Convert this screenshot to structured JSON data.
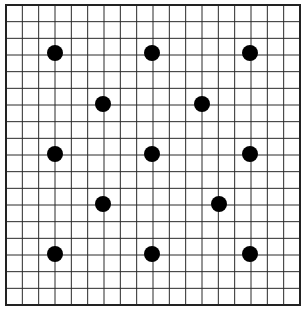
{
  "diagram": {
    "type": "dot-grid",
    "grid": {
      "columns": 18,
      "rows": 18,
      "left": 6,
      "top": 5,
      "right": 300,
      "bottom": 305,
      "line_color": "#2a2a2a",
      "border_color": "#222222"
    },
    "dot_color": "#000000",
    "dot_radius": 8,
    "dots": [
      {
        "x": 55,
        "y": 53
      },
      {
        "x": 152,
        "y": 53
      },
      {
        "x": 250,
        "y": 53
      },
      {
        "x": 103,
        "y": 104
      },
      {
        "x": 202,
        "y": 104
      },
      {
        "x": 55,
        "y": 154
      },
      {
        "x": 152,
        "y": 154
      },
      {
        "x": 250,
        "y": 154
      },
      {
        "x": 103,
        "y": 204
      },
      {
        "x": 219,
        "y": 204
      },
      {
        "x": 55,
        "y": 254
      },
      {
        "x": 152,
        "y": 254
      },
      {
        "x": 250,
        "y": 254
      }
    ]
  }
}
